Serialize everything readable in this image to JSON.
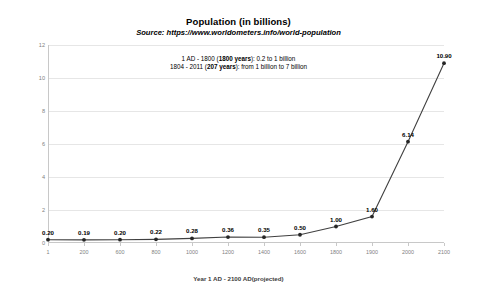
{
  "header": {
    "title": "Population (in billions)",
    "source": "Source: https://www.worldometers.info/world-population",
    "annotation_line1_pre": "1 AD - 1800 (",
    "annotation_line1_bold": "1800 years",
    "annotation_line1_post": "): 0.2 to 1 billion",
    "annotation_line2_pre": "1804 - 2011 (",
    "annotation_line2_bold": "207 years",
    "annotation_line2_post": "): from 1 billion to 7 billion"
  },
  "colors": {
    "line": "#404040",
    "marker": "#262626",
    "grid": "#e6e6e6",
    "axis": "#c8c8c8",
    "tick_text": "#7f7f7f",
    "background": "#ffffff"
  },
  "chart_data": {
    "type": "line",
    "title": "Population (in billions)",
    "subtitle": "Source: https://www.worldometers.info/world-population",
    "xlabel": "Year 1 AD - 2100 AD(projected)",
    "ylabel": "Population in Billions",
    "categories": [
      "1",
      "200",
      "600",
      "800",
      "1000",
      "1200",
      "1400",
      "1600",
      "1800",
      "1900",
      "2000",
      "2100"
    ],
    "values": [
      0.2,
      0.19,
      0.2,
      0.22,
      0.28,
      0.36,
      0.35,
      0.5,
      1.0,
      1.6,
      6.14,
      10.9
    ],
    "point_labels": [
      "0.20",
      "0.19",
      "0.20",
      "0.22",
      "0.28",
      "0.36",
      "0.35",
      "0.50",
      "1.00",
      "1.60",
      "6.14",
      "10.90"
    ],
    "ylim": [
      0,
      12
    ],
    "yticks": [
      0,
      2,
      4,
      6,
      8,
      10,
      12
    ],
    "ytick_labels": [
      "0",
      "2",
      "4",
      "6",
      "8",
      "10",
      "12"
    ],
    "grid": true,
    "legend": false,
    "markers": true,
    "data_labels": true
  }
}
